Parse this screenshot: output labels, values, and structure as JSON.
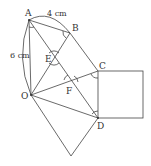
{
  "labels": {
    "A": "A",
    "B": "B",
    "C": "C",
    "D": "D",
    "E": "E",
    "F": "F",
    "O": "O",
    "ab_length": "4 cm",
    "ao_length": "6 cm"
  },
  "colors": {
    "line": "#444444",
    "background": "#ffffff"
  }
}
